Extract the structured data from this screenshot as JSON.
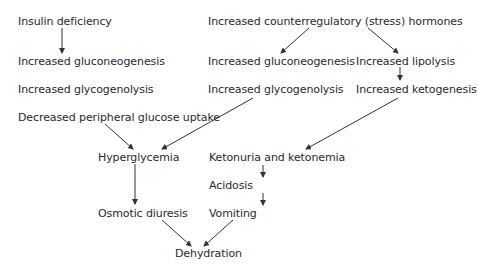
{
  "diagram": {
    "type": "flowchart",
    "nodes": {
      "insulin_deficiency": "Insulin deficiency",
      "counterregulatory": "Increased counterregulatory (stress) hormones",
      "gluconeogenesis_left": "Increased gluconeogenesis",
      "gluconeogenesis_right": "Increased gluconeogenesis",
      "lipolysis": "Increased lipolysis",
      "glycogenolysis_left": "Increased glycogenolysis",
      "glycogenolysis_right": "Increased glycogenolysis",
      "ketogenesis": "Increased ketogenesis",
      "decreased_uptake": "Decreased peripheral glucose uptake",
      "hyperglycemia": "Hyperglycemia",
      "ketonuria": "Ketonuria and ketonemia",
      "acidosis": "Acidosis",
      "osmotic_diuresis": "Osmotic diuresis",
      "vomiting": "Vomiting",
      "dehydration": "Dehydration"
    },
    "edges": [
      [
        "insulin_deficiency",
        "gluconeogenesis_left"
      ],
      [
        "counterregulatory",
        "gluconeogenesis_right"
      ],
      [
        "counterregulatory",
        "lipolysis"
      ],
      [
        "lipolysis",
        "ketogenesis"
      ],
      [
        "decreased_uptake",
        "hyperglycemia"
      ],
      [
        "glycogenolysis_right",
        "hyperglycemia"
      ],
      [
        "ketogenesis",
        "ketonuria"
      ],
      [
        "hyperglycemia",
        "osmotic_diuresis"
      ],
      [
        "ketonuria",
        "acidosis"
      ],
      [
        "acidosis",
        "vomiting"
      ],
      [
        "osmotic_diuresis",
        "dehydration"
      ],
      [
        "vomiting",
        "dehydration"
      ]
    ],
    "colors": {
      "text": "#2a2a2a",
      "line": "#333333",
      "background": "#ffffff"
    }
  }
}
